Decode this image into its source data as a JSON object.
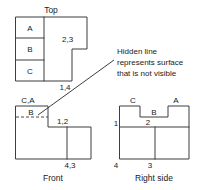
{
  "views": {
    "top": {
      "title": "Top",
      "cells": [
        {
          "label": "A"
        },
        {
          "label": "B"
        },
        {
          "label": "C"
        }
      ],
      "edge_labels": [
        {
          "text": "2,3"
        },
        {
          "text": "1,4"
        }
      ]
    },
    "front": {
      "title": "Front",
      "corner_label": "C,A",
      "surface_label": "B",
      "edge_labels": [
        {
          "text": "1,2"
        },
        {
          "text": "4,3"
        }
      ]
    },
    "right": {
      "title": "Right side",
      "top_labels": [
        {
          "text": "C"
        },
        {
          "text": "A"
        }
      ],
      "surface_label": "B",
      "edge_labels": [
        {
          "text": "1"
        },
        {
          "text": "2"
        },
        {
          "text": "4"
        },
        {
          "text": "3"
        }
      ]
    }
  },
  "annotation": {
    "line1": "Hidden line",
    "line2": "represents surface",
    "line3": "that is not visible"
  },
  "colors": {
    "line": "#3d3d3d",
    "hidden": "#4a4a4a",
    "text": "#1a1a1a",
    "background": "#ffffff"
  }
}
